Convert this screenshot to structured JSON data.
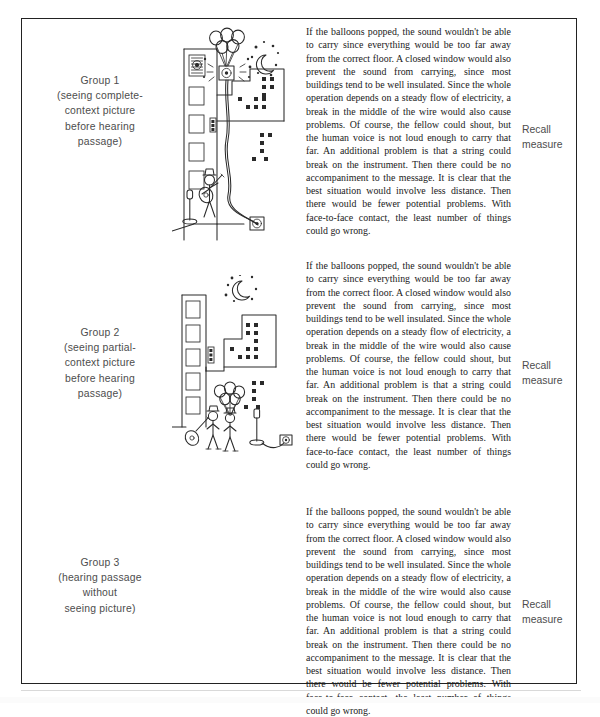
{
  "figure": {
    "caption_visible": false,
    "border_color": "#222222",
    "background": "#ffffff"
  },
  "columns": {
    "group_label_header": "",
    "picture_header": "",
    "passage_header": "",
    "recall_header": ""
  },
  "passage_text": "If the balloons popped, the sound wouldn't be able to carry since everything would be too far away from the correct floor. A closed window would also prevent the sound from carrying, since most buildings tend to be well insulated. Since the whole operation depends on a steady flow of electricity, a break in the middle of the wire would also cause problems. Of course, the fellow could shout, but the human voice is not loud enough to carry that far. An additional problem is that a string could break on the instrument. Then there could be no accompaniment to the message. It is clear that the best situation would involve less distance. Then there would be fewer potential problems. With face-to-face contact, the least number of things could go wrong.",
  "recall": {
    "line1": "Recall",
    "line2": "measure"
  },
  "rows": [
    {
      "id": "group-1",
      "label_title": "Group 1",
      "label_sub_line1": "(seeing complete-",
      "label_sub_line2": "context picture",
      "label_sub_line3": "before hearing",
      "label_sub_line4": "passage)",
      "picture_name": "complete-context-picture",
      "picture_description": "Line drawing: man on ground serenading with guitar beside a microphone on a stand, wired speaker, balloons carrying a loudspeaker up past an apartment building toward a high window; night sky with crescent moon and stars; city skyline at right."
    },
    {
      "id": "group-2",
      "label_title": "Group 2",
      "label_sub_line1": "(seeing partial-",
      "label_sub_line2": "context picture",
      "label_sub_line3": "before hearing",
      "label_sub_line4": "passage)",
      "picture_name": "partial-context-picture",
      "picture_description": "Line drawing with the same elements scattered and disconnected: building facade, crescent moon and stars, city skyline, a small group of figures holding balloons, a microphone on a stand and a speaker, all unrelated in arrangement."
    },
    {
      "id": "group-3",
      "label_title": "Group 3",
      "label_sub_line1": "(hearing passage",
      "label_sub_line2": "without",
      "label_sub_line3": "seeing picture)",
      "label_sub_line4": "",
      "picture_name": "no-picture",
      "picture_description": "No picture shown for this group."
    }
  ]
}
